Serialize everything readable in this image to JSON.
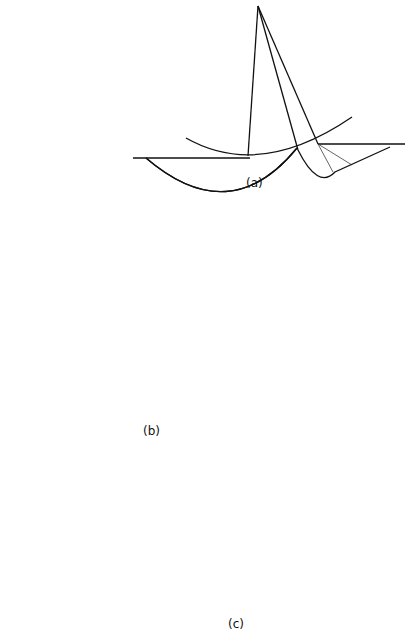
{
  "figure": {
    "panels": [
      {
        "id": "a",
        "label": "(a)"
      },
      {
        "id": "b",
        "label": "(b)"
      },
      {
        "id": "c",
        "label": "(c)"
      }
    ]
  },
  "colors": {
    "ink": "#111111",
    "background": "#ffffff"
  }
}
